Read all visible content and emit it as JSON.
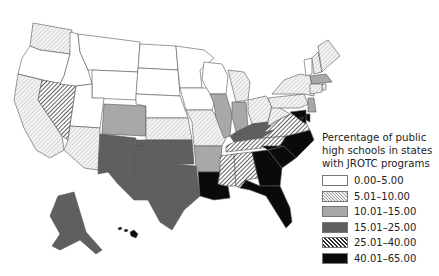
{
  "legend": {
    "title_lines": [
      "Percentage of public",
      "high schools in states",
      "with JROTC programs"
    ],
    "classes": [
      {
        "id": "c0",
        "label": "0.00–5.00",
        "fill": "#ffffff",
        "pattern": "none"
      },
      {
        "id": "c1",
        "label": "5.01–10.00",
        "fill": "#f2f2f2",
        "pattern": "light-hatch"
      },
      {
        "id": "c2",
        "label": "10.01–15.00",
        "fill": "#a8a8a8",
        "pattern": "none"
      },
      {
        "id": "c3",
        "label": "15.01–25.00",
        "fill": "#5f5f5f",
        "pattern": "none"
      },
      {
        "id": "c4",
        "label": "25.01–40.00",
        "fill": "#444444",
        "pattern": "dense-hatch"
      },
      {
        "id": "c5",
        "label": "40.01–65.00",
        "fill": "#0a0a0a",
        "pattern": "none"
      }
    ]
  },
  "states": {
    "WA": "c1",
    "OR": "c0",
    "CA": "c1",
    "NV": "c4",
    "ID": "c0",
    "MT": "c0",
    "WY": "c0",
    "UT": "c0",
    "AZ": "c1",
    "CO": "c2",
    "NM": "c3",
    "ND": "c0",
    "SD": "c0",
    "NE": "c0",
    "KS": "c1",
    "OK": "c3",
    "TX": "c3",
    "MN": "c0",
    "IA": "c0",
    "MO": "c1",
    "AR": "c2",
    "LA": "c5",
    "WI": "c0",
    "IL": "c2",
    "MI": "c1",
    "IN": "c2",
    "OH": "c1",
    "KY": "c3",
    "TN": "c4",
    "MS": "c4",
    "AL": "c4",
    "GA": "c5",
    "FL": "c5",
    "SC": "c5",
    "NC": "c5",
    "VA": "c4",
    "WV": "c1",
    "PA": "c1",
    "NY": "c1",
    "VT": "c0",
    "NH": "c1",
    "ME": "c1",
    "MA": "c2",
    "RI": "c1",
    "CT": "c1",
    "NJ": "c2",
    "DE": "c5",
    "MD": "c5",
    "DC": "c5",
    "AK": "c3",
    "HI": "c5"
  }
}
